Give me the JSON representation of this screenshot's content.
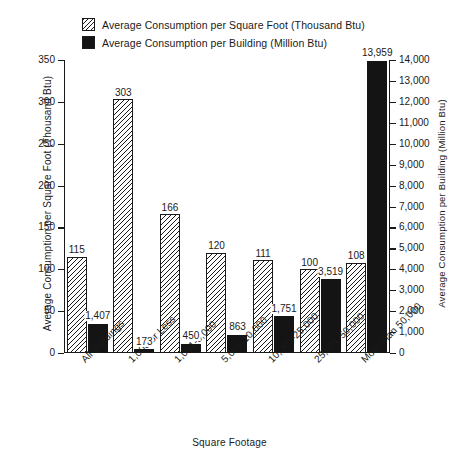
{
  "legend": {
    "items": [
      {
        "label": "Average Consumption per Square Foot (Thousand Btu)",
        "swatch": "hatch-swatch",
        "color": "#1a1a1a"
      },
      {
        "label": "Average Consumption per Building (Million Btu)",
        "swatch": "solid-swatch",
        "color": "#141414"
      }
    ]
  },
  "axes": {
    "left_title": "Average Consumption per Square Foot (Thousand Btu)",
    "right_title": "Average Consumption per Building (Million Btu)",
    "x_title": "Square Footage",
    "left_ticks": [
      "0",
      "50",
      "100",
      "150",
      "200",
      "250",
      "300",
      "350"
    ],
    "right_ticks": [
      "0",
      "1,000",
      "2,000",
      "3,000",
      "4,000",
      "5,000",
      "6,000",
      "7,000",
      "8,000",
      "9,000",
      "10,000",
      "11,000",
      "12,000",
      "13,000",
      "14,000"
    ]
  },
  "chart_data": {
    "type": "bar",
    "title": "",
    "xlabel": "Square Footage",
    "ylabel": "Average Consumption per Square Foot (Thousand Btu)",
    "y2label": "Average Consumption per Building (Million Btu)",
    "ylim": [
      0,
      350
    ],
    "y2lim": [
      0,
      14000
    ],
    "grid": false,
    "legend_position": "top-left",
    "categories": [
      "All Buildings",
      "1,000 or Less",
      "1,001-5,000",
      "5,001-10,000",
      "10,001-25,000",
      "25,001-50,000",
      "More than 50,000"
    ],
    "series": [
      {
        "name": "Average Consumption per Square Foot (Thousand Btu)",
        "axis": "left",
        "style": "hatched",
        "values": [
          115,
          303,
          166,
          120,
          111,
          100,
          108
        ],
        "labels": [
          "115",
          "303",
          "166",
          "120",
          "111",
          "100",
          "108"
        ]
      },
      {
        "name": "Average Consumption per Building (Million Btu)",
        "axis": "right",
        "style": "solid",
        "values": [
          1407,
          173,
          450,
          863,
          1751,
          3519,
          13959
        ],
        "labels": [
          "1,407",
          "173",
          "450",
          "863",
          "1,751",
          "3,519",
          "13,959"
        ]
      }
    ]
  }
}
